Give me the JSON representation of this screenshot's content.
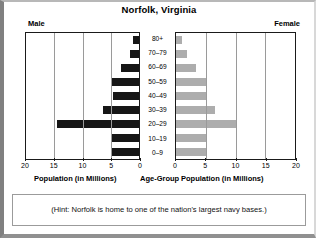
{
  "chart_data": {
    "type": "bar",
    "subtype": "population-pyramid",
    "title": "Norfolk, Virginia",
    "categories": [
      "80+",
      "70–79",
      "60–69",
      "50–59",
      "40–49",
      "30–39",
      "20–29",
      "10–19",
      "0–9"
    ],
    "series": [
      {
        "name": "Male",
        "values": [
          1.0,
          1.6,
          3.2,
          5.0,
          4.6,
          6.3,
          14.6,
          5.0,
          5.0
        ],
        "color": "#161616",
        "side": "left"
      },
      {
        "name": "Female",
        "values": [
          1.0,
          1.8,
          3.4,
          5.2,
          5.0,
          6.6,
          10.0,
          5.2,
          5.2
        ],
        "color": "#adadad",
        "side": "right"
      }
    ],
    "xlabel_left": "Population (in Millions)",
    "xlabel_center": "Age-Group",
    "xlabel_right": "Population (in Millions)",
    "ylabel": "Age-Group",
    "xlim_left": [
      20,
      0
    ],
    "xlim_right": [
      0,
      20
    ],
    "ticks_left": [
      "20",
      "15",
      "10",
      "5",
      "0"
    ],
    "ticks_right": [
      "0",
      "5",
      "10",
      "15",
      "20"
    ],
    "tick_values": [
      0,
      5,
      10,
      15,
      20
    ],
    "grid": true,
    "legend_position": "top-outside",
    "annotation": "(Hint: Norfolk is home to one of the nation's largest navy bases.)"
  },
  "header": {
    "title": "Norfolk, Virginia",
    "male_label": "Male",
    "female_label": "Female"
  },
  "axes": {
    "caption_male": "Population (in Millions)",
    "caption_age": "Age-Group",
    "caption_female": "Population (in Millions)"
  },
  "hint": {
    "text": "(Hint: Norfolk is home to one of the nation's largest navy bases.)"
  }
}
